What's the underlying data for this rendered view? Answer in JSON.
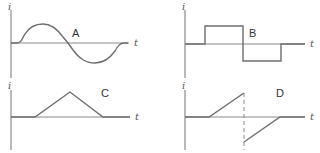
{
  "figure": {
    "panels": [
      {
        "id": "A",
        "label": "A",
        "y_axis_label": "i",
        "x_axis_label": "t",
        "waveform": "sine"
      },
      {
        "id": "B",
        "label": "B",
        "y_axis_label": "i",
        "x_axis_label": "t",
        "waveform": "square-pulse"
      },
      {
        "id": "C",
        "label": "C",
        "y_axis_label": "i",
        "x_axis_label": "t",
        "waveform": "triangle"
      },
      {
        "id": "D",
        "label": "D",
        "y_axis_label": "i",
        "x_axis_label": "t",
        "waveform": "sawtooth-reversal"
      }
    ],
    "colors": {
      "axis": "#8a8a8a",
      "wave": "#6e6e6e",
      "text": "#333333"
    }
  }
}
